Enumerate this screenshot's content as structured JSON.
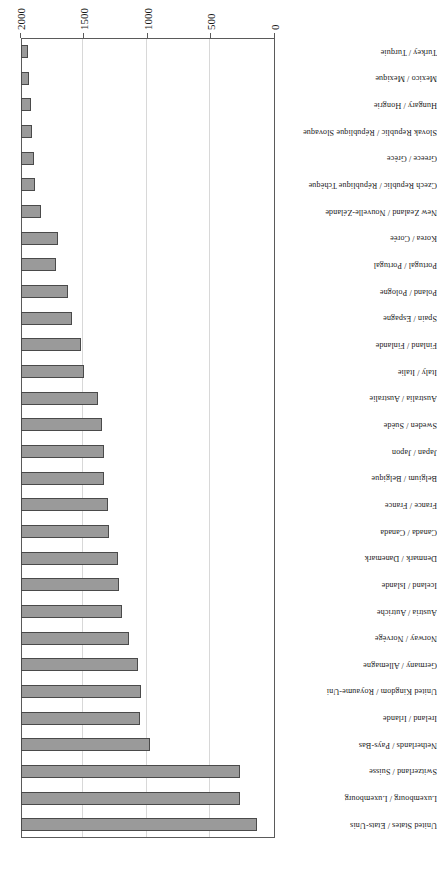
{
  "chart_data": {
    "type": "bar",
    "orientation": "horizontal",
    "title": "",
    "subtitle": "",
    "xlabel": "",
    "ylabel": "",
    "xlim": [
      0,
      2000
    ],
    "ylim": null,
    "grid": true,
    "legend": null,
    "legend_position": "none",
    "xticks": [
      "0",
      "500",
      "1000",
      "1500",
      "2000"
    ],
    "xtick_values": [
      0,
      500,
      1000,
      1500,
      2000
    ],
    "bar_fill_color": "#9a9a9a",
    "bar_border_color": "#4a4a4a",
    "grid_color": "#d8d8d8",
    "frame_color": "#5a5a5a",
    "rotation_degrees": 180,
    "categories": [
      "United States / Etats-Unis",
      "Luxembourg / Luxembourg",
      "Switzerland / Suisse",
      "Netherlands / Pays-Bas",
      "Ireland / Irlande",
      "United Kingdom / Royaume-Uni",
      "Germany / Allemagne",
      "Norway / Norvège",
      "Austria / Autriche",
      "Iceland / Islande",
      "Denmark / Danemark",
      "Canada / Canada",
      "France / France",
      "Belgium / Belgique",
      "Japan / Japon",
      "Sweden / Suède",
      "Australia / Australie",
      "Italy / Italie",
      "Finland / Finlande",
      "Spain / Espagne",
      "Poland / Pologne",
      "Portugal / Portugal",
      "Korea / Corée",
      "New Zealand / Nouvelle-Zélande",
      "Czech Republic / République Tchèque",
      "Greece / Grèce",
      "Slovak Republic / République Slovaque",
      "Hungary / Hongrie",
      "Mexico / Mexique",
      "Turkey / Turquie"
    ],
    "values": [
      1858,
      1724,
      1724,
      1016,
      937,
      945,
      920,
      850,
      795,
      772,
      764,
      693,
      685,
      653,
      653,
      638,
      606,
      495,
      470,
      400,
      370,
      275,
      290,
      157,
      110,
      102,
      87,
      79,
      63,
      55
    ]
  },
  "page": {
    "number": ""
  }
}
